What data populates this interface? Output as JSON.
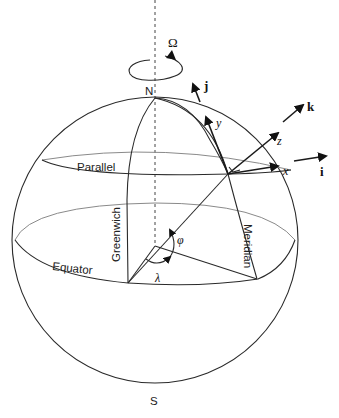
{
  "diagram": {
    "labels": {
      "omega": "Ω",
      "north": "N",
      "south": "S",
      "parallel": "Parallel",
      "equator": "Equator",
      "greenwich": "Greenwich",
      "meridian": "Meridian",
      "latitude": "φ",
      "longitude": "λ",
      "axis_x": "x",
      "axis_y": "y",
      "axis_z": "z",
      "unit_i": "i",
      "unit_j": "j",
      "unit_k": "k"
    },
    "colors": {
      "stroke": "#2a2a2a",
      "back_stroke": "#8a8a8a",
      "background": "#ffffff"
    }
  }
}
